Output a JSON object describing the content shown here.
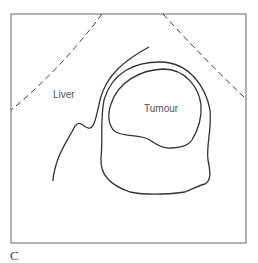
{
  "figure": {
    "panel_letter": "C",
    "labels": {
      "liver": "Liver",
      "tumour": "Tumour"
    },
    "colors": {
      "stroke": "#333333",
      "frame": "#666666",
      "text": "#555555"
    }
  }
}
